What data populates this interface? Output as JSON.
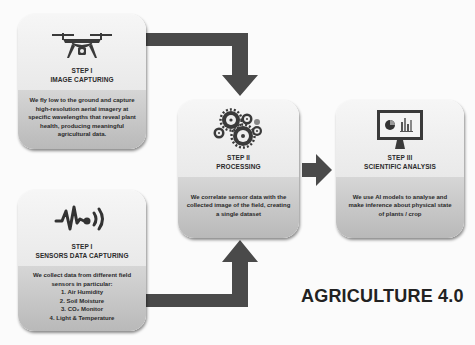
{
  "title": "AGRICULTURE 4.0",
  "colors": {
    "arrow": "#4a4a4a",
    "card_top": "#f0f0f0",
    "card_bottom": "#c4c4c4",
    "text": "#2a2a2a",
    "background": "#fbfbfb"
  },
  "steps": [
    {
      "id": "image-capturing",
      "icon": "drone-icon",
      "label": "STEP I",
      "title": "IMAGE CAPTURING",
      "description": "We fly low to the ground and capture high-resolution aerial imagery at specific wavelengths that reveal plant health, producing meaningful agricultural data."
    },
    {
      "id": "sensors-data-capturing",
      "icon": "sensor-signal-icon",
      "label": "STEP I",
      "title": "SENSORS DATA CAPTURING",
      "description": "We collect data from different field sensors in particular:",
      "list": [
        "1. Air Humidity",
        "2. Soil Moisture",
        "3. CO₂ Monitor",
        "4. Light & Temperature"
      ]
    },
    {
      "id": "processing",
      "icon": "gears-icon",
      "label": "STEP II",
      "title": "PROCESSING",
      "description": "We correlate sensor data with the collected image of the field, creating a single dataset"
    },
    {
      "id": "scientific-analysis",
      "icon": "monitor-chart-icon",
      "label": "STEP III",
      "title": "SCIENTIFIC ANALYSIS",
      "description": "We use AI models to analyse and make inference about physical state of plants / crop"
    }
  ]
}
